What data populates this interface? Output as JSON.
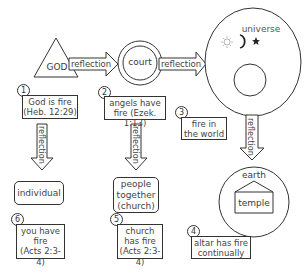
{
  "diagram": {
    "nodes": {
      "god": {
        "label": "GOD",
        "shape": "triangle"
      },
      "court": {
        "label": "court",
        "shape": "double-circle"
      },
      "universe": {
        "label": "universe",
        "shape": "oval",
        "icons": [
          "sun-icon",
          "moon-icon",
          "star-icon"
        ]
      },
      "earth": {
        "label": "earth",
        "shape": "circle"
      },
      "temple": {
        "label": "temple",
        "shape": "house"
      },
      "individual": {
        "label": "individual",
        "shape": "rounded-box"
      },
      "people": {
        "label_lines": [
          "people",
          "together",
          "(church)"
        ],
        "shape": "rounded-box"
      }
    },
    "arrows": {
      "god_to_court": "reflection",
      "court_to_universe": "reflection",
      "universe_to_earth": "reflection",
      "box1_to_individual": "reflection",
      "box2_to_people": "reflection"
    },
    "notes": [
      {
        "num": "1",
        "lines": [
          "God is fire",
          "(Heb. 12:29)"
        ]
      },
      {
        "num": "2",
        "lines": [
          "angels have",
          "fire (Ezek. 1:13)"
        ]
      },
      {
        "num": "3",
        "lines": [
          "fire in",
          "the world"
        ]
      },
      {
        "num": "4",
        "lines": [
          "altar has fire",
          "continually"
        ]
      },
      {
        "num": "5",
        "lines": [
          "church",
          "has fire",
          "(Acts 2:3-4)"
        ]
      },
      {
        "num": "6",
        "lines": [
          "you have",
          "fire",
          "(Acts 2:3-4)"
        ]
      }
    ]
  }
}
